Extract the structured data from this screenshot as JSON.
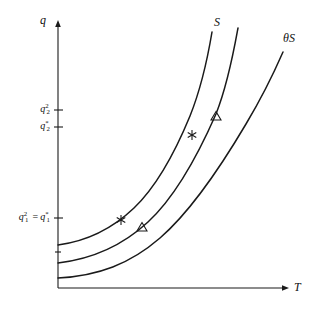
{
  "figure": {
    "type": "line-diagram",
    "background_color": "#ffffff",
    "ink_color": "#1a1a1a",
    "axes": {
      "y_axis_label": "q",
      "x_axis_label": "T",
      "x_axis_arrow": true,
      "y_axis_arrow": true,
      "grid": false
    },
    "y_ticks": [
      {
        "id": "q2-squared",
        "base": "q",
        "sub": "2",
        "sup": "2",
        "text": "q₂²",
        "pixel_y": 110
      },
      {
        "id": "q2-star",
        "base": "q",
        "sub": "2",
        "sup": "*",
        "text": "q₂*",
        "pixel_y": 127
      },
      {
        "id": "q1-equality",
        "base": "q",
        "sub": "1",
        "sup": "2",
        "equals": "=",
        "base2": "q",
        "sub2": "1",
        "sup2": "*",
        "text": "q₁² = q₁*",
        "pixel_y": 218
      },
      {
        "id": "unlabeled-low-tick",
        "base": "",
        "sub": "",
        "sup": "",
        "text": "",
        "pixel_y": 252
      }
    ],
    "curves": [
      {
        "name": "steepest-curve",
        "label": "",
        "label_position": "none",
        "start": [
          58,
          245
        ],
        "end": [
          212,
          32
        ]
      },
      {
        "name": "middle-curve",
        "label": "S",
        "label_position": "top",
        "start": [
          58,
          263
        ],
        "end": [
          238,
          28
        ]
      },
      {
        "name": "theta-s-curve",
        "label": "θS",
        "label_position": "top-right",
        "start": [
          58,
          278
        ],
        "end": [
          283,
          52
        ]
      }
    ],
    "markers": [
      {
        "name": "star-marker-lower",
        "glyph": "star",
        "x": 121,
        "y": 220,
        "on_curve": "steepest-curve"
      },
      {
        "name": "triangle-marker-lower",
        "glyph": "triangle",
        "x": 142,
        "y": 228,
        "on_curve": "theta-s-curve"
      },
      {
        "name": "star-marker-upper",
        "glyph": "star",
        "x": 192,
        "y": 135,
        "on_curve": "steepest-curve"
      },
      {
        "name": "triangle-marker-upper",
        "glyph": "triangle",
        "x": 216,
        "y": 117,
        "on_curve": "middle-curve"
      }
    ]
  }
}
